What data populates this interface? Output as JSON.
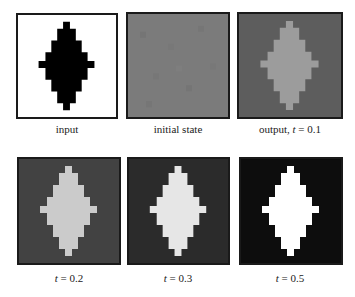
{
  "figure": {
    "panels": [
      {
        "id": "input",
        "label_prefix": "input",
        "label_t": "",
        "label_eq": "",
        "bg": "#ffffff",
        "fg": "#000000"
      },
      {
        "id": "initial",
        "label_prefix": "initial state",
        "label_t": "",
        "label_eq": "",
        "bg": "#7b7b7b",
        "fg": "#7b7b7b"
      },
      {
        "id": "t01",
        "label_prefix": "output, ",
        "label_t": "t",
        "label_eq": " = 0.1",
        "bg": "#5d5d5d",
        "fg": "#9c9c9c"
      },
      {
        "id": "t02",
        "label_prefix": "",
        "label_t": "t",
        "label_eq": " = 0.2",
        "bg": "#424242",
        "fg": "#cbcbcb"
      },
      {
        "id": "t03",
        "label_prefix": "",
        "label_t": "t",
        "label_eq": " = 0.3",
        "bg": "#2b2b2b",
        "fg": "#e6e6e6"
      },
      {
        "id": "t05",
        "label_prefix": "",
        "label_t": "t",
        "label_eq": " = 0.5",
        "bg": "#0d0d0d",
        "fg": "#ffffff"
      }
    ]
  }
}
